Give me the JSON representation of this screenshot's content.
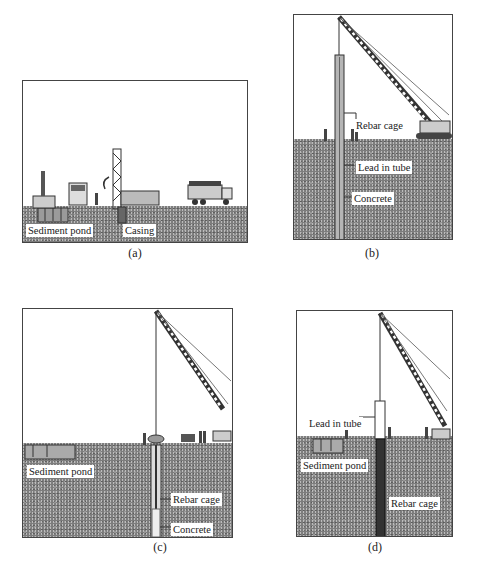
{
  "figure": {
    "panels": [
      {
        "id": "a",
        "caption": "(a)",
        "labels": {
          "sediment_pond": "Sediment pond",
          "casing": "Casing"
        }
      },
      {
        "id": "b",
        "caption": "(b)",
        "labels": {
          "rebar_cage": "Rebar cage",
          "lead_in_tube": "Lead in tube",
          "concrete": "Concrete"
        }
      },
      {
        "id": "c",
        "caption": "(c)",
        "labels": {
          "sediment_pond": "Sediment pond",
          "rebar_cage": "Rebar cage",
          "concrete": "Concrete"
        }
      },
      {
        "id": "d",
        "caption": "(d)",
        "labels": {
          "lead_in_tube": "Lead in tube",
          "sediment_pond": "Sediment pond",
          "rebar_cage": "Rebar cage"
        }
      }
    ]
  }
}
